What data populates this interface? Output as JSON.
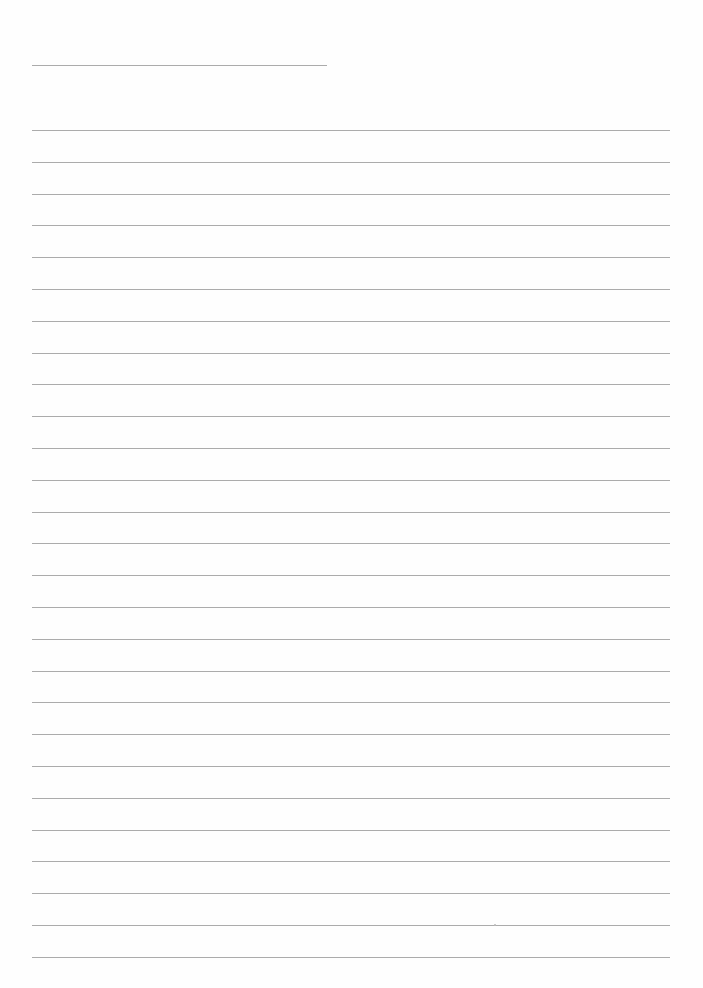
{
  "document": {
    "type": "lined-notebook-page",
    "text": "",
    "header_line": {
      "x1": 32,
      "x2": 327,
      "y": 65
    },
    "ruled_lines": {
      "x1": 32,
      "x2": 670,
      "first_y": 130,
      "spacing": 31.8,
      "count": 27
    },
    "line_color": "#9c9c9c",
    "paper_color": "#fefefe"
  }
}
